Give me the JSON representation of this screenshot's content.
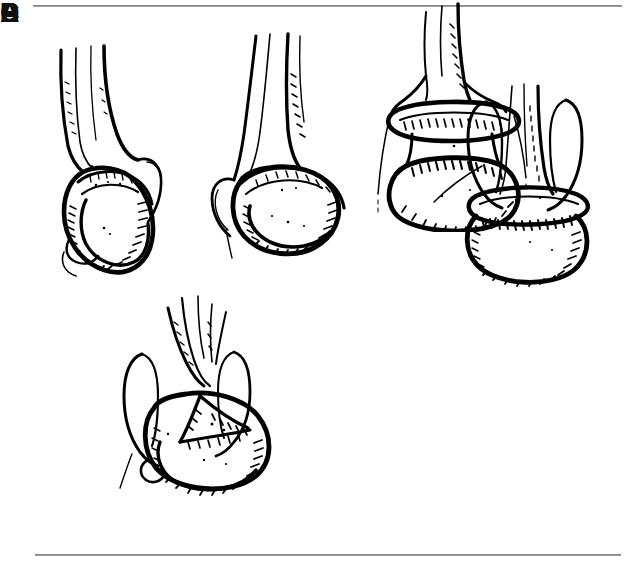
{
  "figure": {
    "kind": "anatomical-line-drawing-plate",
    "background_color": "#ffffff",
    "ink_color": "#000000",
    "rule_color": "#8f8f8f",
    "width": 636,
    "height": 572
  },
  "rules": {
    "top_label": "top-divider-rule",
    "bottom_label": "bottom-divider-rule"
  },
  "panels": [
    {
      "id": "a",
      "label": "A",
      "label_style": "bold",
      "caption": "Oblique view of distal bone end with rounded condyle and overlying epicondylar ridge"
    },
    {
      "id": "b",
      "label": "B",
      "label_style": "bold",
      "caption": "Oblique view with condyle tilted, medial epicondyle hook visible at lower left"
    },
    {
      "id": "c",
      "label": "C",
      "label_style": "bold",
      "caption": "Anterior view showing both epicondyles flanking shaft above a broad transverse condyle"
    },
    {
      "id": "d",
      "label": "D",
      "label_style": "bold",
      "caption": "Anterior oblique view with intercondylar fracture lines radiating across the articular surface"
    },
    {
      "id": "e",
      "label": "E",
      "label_style": "thin",
      "caption": "Anterior view with transverse supracondylar separation of the epiphysis from the shaft"
    }
  ]
}
